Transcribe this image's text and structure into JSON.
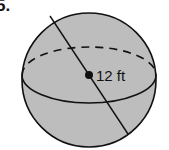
{
  "problem": {
    "number": "5."
  },
  "figure": {
    "shape": "sphere",
    "label": "12 ft",
    "measurement": "diameter",
    "fill_color": "#bdbdbd",
    "stroke_color": "#111111"
  }
}
